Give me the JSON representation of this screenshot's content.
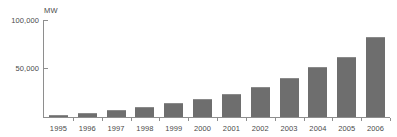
{
  "chart_data": {
    "type": "bar",
    "title": "",
    "subtitle": "",
    "xlabel": "",
    "ylabel": "MW",
    "unit_label": "MW",
    "categories": [
      "1995",
      "1996",
      "1997",
      "1998",
      "1999",
      "2000",
      "2001",
      "2002",
      "2003",
      "2004",
      "2005",
      "2006"
    ],
    "values": [
      2000,
      4500,
      7500,
      10000,
      14000,
      18500,
      24000,
      31000,
      40000,
      52000,
      62000,
      82000
    ],
    "series": [
      {
        "name": "Installed capacity",
        "values": [
          2000,
          4500,
          7500,
          10000,
          14000,
          18500,
          24000,
          31000,
          40000,
          52000,
          62000,
          82000
        ]
      }
    ],
    "ylim": [
      0,
      100000
    ],
    "ytick_values": [
      50000,
      100000
    ],
    "ytick_labels": [
      "50,000",
      "100,000"
    ],
    "grid": false,
    "legend": false,
    "legend_position": "none",
    "bar_color": "#6e6e6e",
    "axis_color": "#8e8e8e",
    "text_color": "#4a4a4a",
    "background_color": "#ffffff"
  },
  "axis": {
    "y_unit": "MW",
    "y_tick_top": "100,000",
    "y_tick_mid": "50,000"
  },
  "labels": {
    "x": [
      "1995",
      "1996",
      "1997",
      "1998",
      "1999",
      "2000",
      "2001",
      "2002",
      "2003",
      "2004",
      "2005",
      "2006"
    ]
  }
}
